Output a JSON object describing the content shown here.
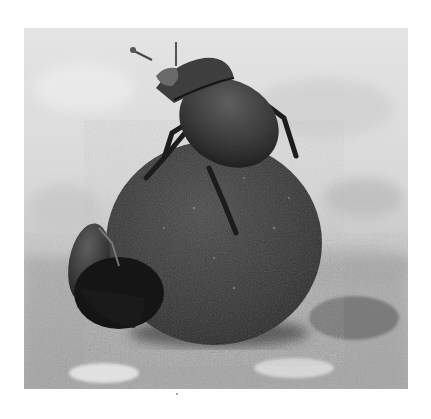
{
  "image": {
    "subject": "Two dung beetles on a dung ball",
    "style": "black-and-white photograph",
    "colors": {
      "background_light": "#e2e2e2",
      "background_mid": "#cfcfcf",
      "ground": "#9a9a9a",
      "ball": "#3a3a3a",
      "beetle": "#2a2a2a",
      "beetle_highlight": "#5a5a5a"
    }
  }
}
